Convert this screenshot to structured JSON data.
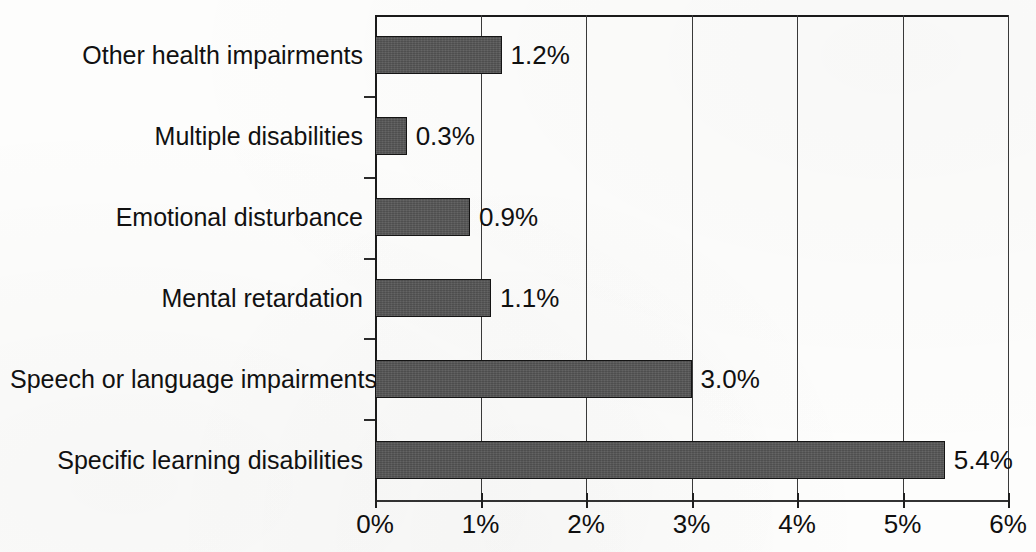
{
  "chart_data": {
    "type": "bar",
    "orientation": "horizontal",
    "title": "",
    "subtitle": "",
    "xlabel": "",
    "ylabel": "",
    "categories": [
      "Other health impairments",
      "Multiple disabilities",
      "Emotional disturbance",
      "Mental retardation",
      "Speech or language impairments",
      "Specific learning disabilities"
    ],
    "values": [
      1.2,
      0.3,
      0.9,
      1.1,
      3.0,
      5.4
    ],
    "value_labels": [
      "1.2%",
      "0.3%",
      "0.9%",
      "1.1%",
      "3.0%",
      "5.4%"
    ],
    "xlim": [
      0,
      6
    ],
    "xticks": [
      0,
      1,
      2,
      3,
      4,
      5,
      6
    ],
    "xtick_labels": [
      "0%",
      "1%",
      "2%",
      "3%",
      "4%",
      "5%",
      "6%"
    ],
    "grid": "vertical",
    "legend": "none",
    "series": [
      {
        "name": "Percent of enrollment",
        "values": [
          1.2,
          0.3,
          0.9,
          1.1,
          3.0,
          5.4
        ]
      }
    ],
    "colors": {
      "bar_fill": "#565656",
      "bar_border": "#141414",
      "axis": "#1a1a1a",
      "gridline": "#3a3a3a",
      "text": "#111111",
      "background": "#fdfdfc"
    }
  }
}
